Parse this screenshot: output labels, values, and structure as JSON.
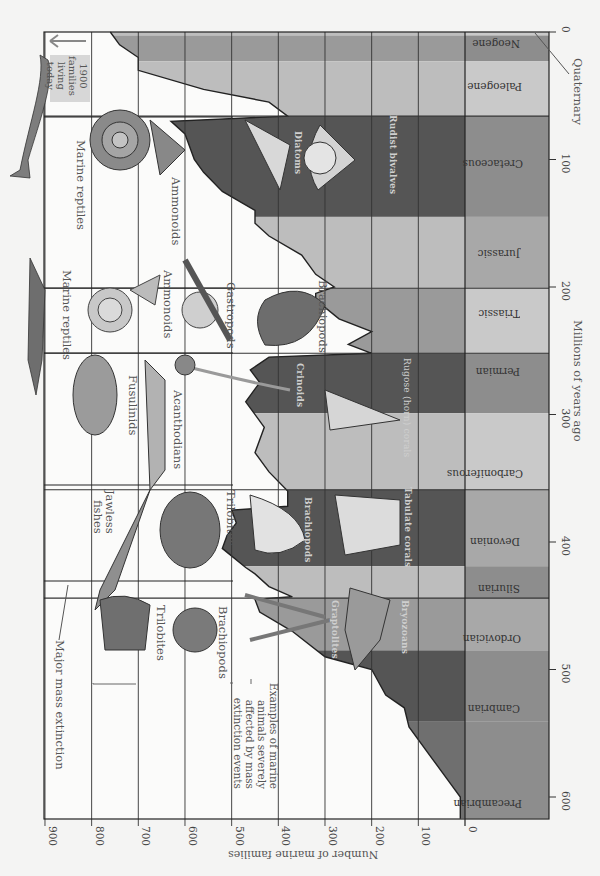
{
  "chart_data": {
    "type": "area",
    "title": "",
    "orientation_note": "figure rendered rotated 90 degrees clockwise",
    "xlabel": "Millions of years ago",
    "ylabel": "Number of marine families",
    "xlim": [
      617,
      0
    ],
    "ylim": [
      0,
      900
    ],
    "x_ticks": [
      0,
      100,
      200,
      300,
      400,
      500,
      600
    ],
    "y_ticks": [
      0,
      100,
      200,
      300,
      400,
      500,
      600,
      700,
      800,
      900
    ],
    "grid": true,
    "series": [
      {
        "name": "Number of marine families",
        "x": [
          617,
          600,
          590,
          570,
          545,
          530,
          520,
          500,
          490,
          470,
          455,
          445,
          443,
          435,
          425,
          420,
          405,
          395,
          385,
          375,
          372,
          360,
          345,
          330,
          310,
          290,
          275,
          265,
          255,
          252,
          245,
          235,
          225,
          210,
          205,
          200,
          190,
          175,
          160,
          150,
          140,
          125,
          110,
          100,
          80,
          70,
          66,
          55,
          45,
          30,
          20,
          10,
          0
        ],
        "y": [
          10,
          10,
          30,
          70,
          120,
          130,
          170,
          200,
          300,
          370,
          440,
          450,
          370,
          420,
          450,
          470,
          520,
          510,
          490,
          500,
          380,
          380,
          420,
          450,
          430,
          470,
          440,
          460,
          420,
          200,
          250,
          200,
          270,
          320,
          320,
          280,
          320,
          350,
          420,
          450,
          450,
          520,
          560,
          580,
          600,
          630,
          380,
          420,
          560,
          700,
          700,
          740,
          760
        ]
      }
    ],
    "periods": [
      {
        "name": "Neogene",
        "start": 23,
        "end": 2.6
      },
      {
        "name": "Quaternary",
        "start": 2.6,
        "end": 0
      },
      {
        "name": "Paleogene",
        "start": 66,
        "end": 23
      },
      {
        "name": "Cretaceous",
        "start": 145,
        "end": 66
      },
      {
        "name": "Jurassic",
        "start": 201,
        "end": 145
      },
      {
        "name": "Triassic",
        "start": 252,
        "end": 201
      },
      {
        "name": "Permian",
        "start": 299,
        "end": 252
      },
      {
        "name": "Carboniferous",
        "start": 359,
        "end": 299
      },
      {
        "name": "Devonian",
        "start": 419,
        "end": 359
      },
      {
        "name": "Silurian",
        "start": 444,
        "end": 419
      },
      {
        "name": "Ordovician",
        "start": 485,
        "end": 444
      },
      {
        "name": "Cambrian",
        "start": 541,
        "end": 485
      },
      {
        "name": "Precambrian",
        "start": 617,
        "end": 541
      }
    ],
    "mass_extinctions_ma": [
      444,
      372,
      252,
      201,
      66
    ],
    "annotations": [
      {
        "text": "1900 families living today",
        "at_ma": 0
      },
      {
        "text": "Major mass extinction"
      },
      {
        "text": "Examples of marine animals severely affected by mass extinction events"
      }
    ],
    "affected_groups": [
      {
        "event_ma": 444,
        "groups": [
          "Trilobites",
          "Brachiopods",
          "Graptolites",
          "Bryozoans"
        ]
      },
      {
        "event_ma": 372,
        "groups": [
          "Jawless fishes",
          "Trilobites",
          "Brachiopods",
          "Tabulate corals"
        ]
      },
      {
        "event_ma": 252,
        "groups": [
          "Fusulinids",
          "Acanthodians",
          "Crinoids",
          "Rugose (horn) corals"
        ]
      },
      {
        "event_ma": 201,
        "groups": [
          "Marine reptiles",
          "Ammonoids",
          "Gastropods",
          "Brachiopods"
        ]
      },
      {
        "event_ma": 66,
        "groups": [
          "Marine reptiles",
          "Ammonoids",
          "Diatoms",
          "Rudist bivalves"
        ]
      }
    ]
  },
  "labels": {
    "xlabel": "Millions of years ago",
    "ylabel": "Number of marine families",
    "x_ticks": [
      "0",
      "100",
      "200",
      "300",
      "400",
      "500",
      "600"
    ],
    "y_ticks": [
      "900",
      "800",
      "700",
      "600",
      "500",
      "400",
      "300",
      "200",
      "100",
      "0"
    ],
    "quaternary": "Quaternary",
    "today_line1": "1900",
    "today_line2": "families",
    "today_line3": "living",
    "today_line4": "today",
    "major_extinction": "Major mass extinction",
    "examples_note_1": "Examples of marine",
    "examples_note_2": "animals severely",
    "examples_note_3": "affected by mass",
    "examples_note_4": "extinction events",
    "periods": {
      "neogene": "Neogene",
      "paleogene": "Paleogene",
      "cretaceous": "Cretaceous",
      "jurassic": "Jurassic",
      "triassic": "Triassic",
      "permian": "Permian",
      "carboniferous": "Carboniferous",
      "devonian": "Devonian",
      "silurian": "Silurian",
      "ordovician": "Ordovician",
      "cambrian": "Cambrian",
      "precambrian": "Precambrian"
    },
    "animals": {
      "k_marine_reptiles": "Marine reptiles",
      "k_ammonoids": "Ammonoids",
      "k_diatoms": "Diatoms",
      "k_rudist": "Rudist bivalves",
      "tr_marine_reptiles": "Marine reptiles",
      "tr_ammonoids": "Ammonoids",
      "tr_gastropods": "Gastropods",
      "tr_brachiopods": "Brachiopods",
      "p_fusulinids": "Fusulinids",
      "p_acanthodians": "Acanthodians",
      "p_crinoids": "Crinoids",
      "p_rugose": "Rugose (horn) corals",
      "d_jawless_1": "Jawless",
      "d_jawless_2": "fishes",
      "d_trilobites": "Trilobites",
      "d_brachiopods": "Brachiopods",
      "d_tabulate": "Tabulate corals",
      "o_trilobites": "Trilobites",
      "o_brachiopods": "Brachiopods",
      "o_graptolites": "Graptolites",
      "o_bryozoans": "Bryozoans"
    }
  },
  "colors": {
    "background": "#f4f4f3",
    "plot_white": "#fbfbfa",
    "band_light": "#bdbdbd",
    "band_mid": "#9a9a9a",
    "band_dark": "#6f6f6f",
    "band_darkest": "#555555",
    "period_bar_light": "#c9c9c9",
    "period_bar_mid": "#a8a8a8",
    "period_bar_dark": "#8d8d8d",
    "grid": "#333333"
  }
}
